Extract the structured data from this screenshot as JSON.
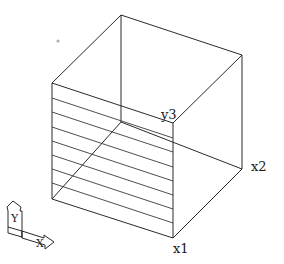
{
  "labels": {
    "y3": "y3",
    "x2": "x2",
    "x1": "x1",
    "ucs_y": "Y",
    "ucs_x": "X"
  },
  "colors": {
    "background": "#ffffff",
    "lines": "#2a2a2a",
    "dot": "#b0b0b0"
  }
}
